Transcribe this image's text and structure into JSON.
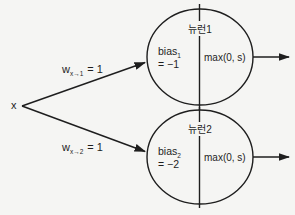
{
  "diagram": {
    "type": "two-neuron-network",
    "colors": {
      "background": "#f5f5f3",
      "stroke": "#1e1e1e"
    },
    "input": {
      "label": "x"
    },
    "weights": [
      {
        "base": "w",
        "sub": "x→1",
        "value": "= 1"
      },
      {
        "base": "w",
        "sub": "x→2",
        "value": "= 1"
      }
    ],
    "neurons": [
      {
        "title": "뉴런1",
        "bias_base": "bias",
        "bias_sub": "1",
        "bias_value": "= −1",
        "activation": "max(0, s)"
      },
      {
        "title": "뉴런2",
        "bias_base": "bias",
        "bias_sub": "2",
        "bias_value": "= −2",
        "activation": "max(0, s)"
      }
    ]
  }
}
